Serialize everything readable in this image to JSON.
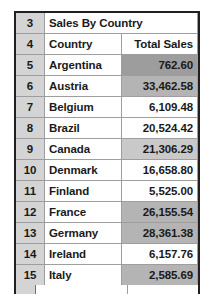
{
  "spreadsheet": {
    "title_row": {
      "row_number": "3",
      "title": "Sales By Country"
    },
    "header_row": {
      "row_number": "4",
      "columns": [
        "Country",
        "Total Sales"
      ]
    },
    "rows": [
      {
        "row_number": "5",
        "country": "Argentina",
        "total_sales": "762.60",
        "shade": "shade-dark"
      },
      {
        "row_number": "6",
        "country": "Austria",
        "total_sales": "33,462.58",
        "shade": "shade-mid"
      },
      {
        "row_number": "7",
        "country": "Belgium",
        "total_sales": "6,109.48",
        "shade": "shade-none"
      },
      {
        "row_number": "8",
        "country": "Brazil",
        "total_sales": "20,524.42",
        "shade": "shade-none"
      },
      {
        "row_number": "9",
        "country": "Canada",
        "total_sales": "21,306.29",
        "shade": "shade-light"
      },
      {
        "row_number": "10",
        "country": "Denmark",
        "total_sales": "16,658.80",
        "shade": "shade-none"
      },
      {
        "row_number": "11",
        "country": "Finland",
        "total_sales": "5,525.00",
        "shade": "shade-none"
      },
      {
        "row_number": "12",
        "country": "France",
        "total_sales": "26,155.54",
        "shade": "shade-mid"
      },
      {
        "row_number": "13",
        "country": "Germany",
        "total_sales": "28,361.38",
        "shade": "shade-mid"
      },
      {
        "row_number": "14",
        "country": "Ireland",
        "total_sales": "6,157.76",
        "shade": "shade-none"
      },
      {
        "row_number": "15",
        "country": "Italy",
        "total_sales": "2,585.69",
        "shade": "shade-mid"
      }
    ],
    "colors": {
      "row_header_background": "#d4d4d4",
      "grid_line": "#9e9e9e",
      "outer_border": "#231f20",
      "text": "#1a1a1a",
      "shade_dark": "#9d9d9d",
      "shade_mid": "#b4b4b4",
      "shade_light": "#c9c9c9"
    }
  }
}
